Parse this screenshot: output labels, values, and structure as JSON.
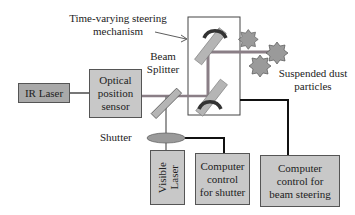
{
  "diagram": {
    "labels": {
      "steering_mechanism": [
        "Time-varying steering",
        "mechanism"
      ],
      "beam_splitter": [
        "Beam",
        "Splitter"
      ],
      "shutter": "Shutter",
      "dust": [
        "Suspended dust",
        "particles"
      ]
    },
    "boxes": {
      "ir_laser": "IR Laser",
      "optical_sensor": [
        "Optical",
        "position",
        "sensor"
      ],
      "visible_laser": [
        "Visible",
        "Laser"
      ],
      "shutter_control": [
        "Computer",
        "control",
        "for shutter"
      ],
      "steering_control": [
        "Computer",
        "control for",
        "beam steering"
      ]
    },
    "colors": {
      "ir_box": "#a9a9a9",
      "box_fill": "#c8c8c8",
      "beam": "#8a7e86",
      "mirror": "#b5b5b5",
      "dust": "#9a9a9a",
      "wire": "#111111"
    }
  }
}
